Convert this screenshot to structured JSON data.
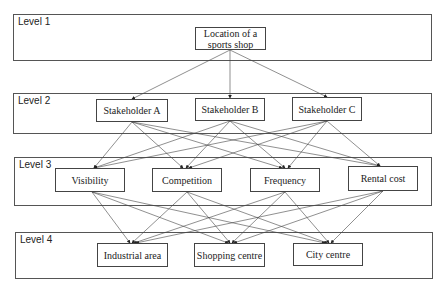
{
  "levels": [
    {
      "label": "Level 1",
      "nodes": [
        {
          "id": "root",
          "label": "Location of a sports shop"
        }
      ]
    },
    {
      "label": "Level 2",
      "nodes": [
        {
          "id": "sA",
          "label": "Stakeholder A"
        },
        {
          "id": "sB",
          "label": "Stakeholder B"
        },
        {
          "id": "sC",
          "label": "Stakeholder C"
        }
      ]
    },
    {
      "label": "Level 3",
      "nodes": [
        {
          "id": "vis",
          "label": "Visibility"
        },
        {
          "id": "comp",
          "label": "Competition"
        },
        {
          "id": "freq",
          "label": "Frequency"
        },
        {
          "id": "rent",
          "label": "Rental cost"
        }
      ]
    },
    {
      "label": "Level 4",
      "nodes": [
        {
          "id": "ind",
          "label": "Industrial area"
        },
        {
          "id": "shop",
          "label": "Shopping centre"
        },
        {
          "id": "city",
          "label": "City centre"
        }
      ]
    }
  ],
  "edges_description": "Each node connects with an arrow to every node in the next level (fully connected hierarchy)",
  "colors": {
    "line": "#444444",
    "frame": "#555555",
    "text": "#222222"
  }
}
